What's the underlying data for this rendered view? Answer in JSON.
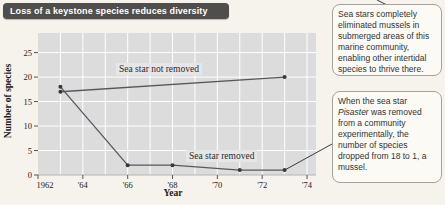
{
  "title_bar": {
    "label": "Loss of a keystone species reduces diversity"
  },
  "chart_data": {
    "type": "line",
    "title": "Loss of a keystone species reduces diversity",
    "xlabel": "Year",
    "ylabel": "Number of species",
    "xlim": [
      1962,
      1974.4
    ],
    "ylim": [
      0,
      29
    ],
    "grid": "on",
    "x_ticks": [
      {
        "x": 1962,
        "label": "1962"
      },
      {
        "x": 1964,
        "label": "'64"
      },
      {
        "x": 1966,
        "label": "'66"
      },
      {
        "x": 1968,
        "label": "'68"
      },
      {
        "x": 1970,
        "label": "'70"
      },
      {
        "x": 1972,
        "label": "'72"
      },
      {
        "x": 1974,
        "label": "'74"
      }
    ],
    "y_ticks": [
      {
        "y": 0,
        "label": "0"
      },
      {
        "y": 5,
        "label": "5"
      },
      {
        "y": 10,
        "label": "10"
      },
      {
        "y": 15,
        "label": "15"
      },
      {
        "y": 20,
        "label": "20"
      },
      {
        "y": 25,
        "label": "25"
      }
    ],
    "series": [
      {
        "name": "Sea star not removed",
        "points": [
          [
            1963,
            17
          ],
          [
            1973,
            20
          ]
        ]
      },
      {
        "name": "Sea star removed",
        "points": [
          [
            1963,
            18
          ],
          [
            1966,
            2
          ],
          [
            1968,
            2
          ],
          [
            1971,
            1
          ],
          [
            1973,
            1
          ]
        ]
      }
    ],
    "colors": {
      "plot_bg": "#dcdcdc",
      "gridline": "#ffffff",
      "line": "#5a5660",
      "marker": "#39373d",
      "tick": "#555555",
      "leader": "#3c3a40"
    }
  },
  "series_labels": {
    "not_removed": "Sea star not removed",
    "removed": "Sea star removed"
  },
  "axis_titles": {
    "x": "Year",
    "y": "Number of species"
  },
  "callouts": {
    "one": {
      "text": "Sea stars completely eliminated mussels in submerged areas of this marine community, enabling other intertidal species to thrive there."
    },
    "two": {
      "pre": "When the sea star ",
      "italic": "Pisaster",
      "post": " was removed from a community experimentally, the number of species dropped from 18 to 1, a mussel."
    }
  }
}
